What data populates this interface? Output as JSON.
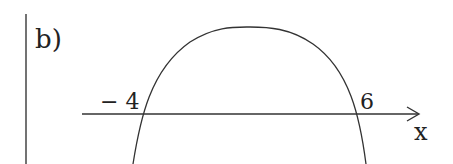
{
  "part_label": "b)",
  "axis": {
    "label": "x"
  },
  "roots": [
    {
      "label": "− 4",
      "value": -4
    },
    {
      "label": "6",
      "value": 6
    }
  ],
  "curve": {
    "type": "downward-opening parabola",
    "description": "sign chart sketch, positive between -4 and 6"
  },
  "colors": {
    "ink": "#222222",
    "background": "#ffffff"
  }
}
